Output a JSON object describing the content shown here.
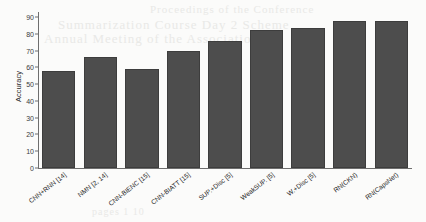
{
  "chart_data": {
    "type": "bar",
    "title": "",
    "xlabel": "",
    "ylabel": "Accuracy",
    "ylim": [
      0,
      93
    ],
    "yticks": [
      0,
      10,
      20,
      30,
      40,
      50,
      60,
      70,
      80,
      90
    ],
    "grid": false,
    "legend": null,
    "bar_color": "#4d4d4d",
    "categories": [
      "CNN+RNN [14]",
      "NMN [2, 14]",
      "CNN-BIENC [15]",
      "CNN-BIATT [15]",
      "SUP.+Disc [5]",
      "WeakSUP. [5]",
      "W.+Disc [5]",
      "RN(CKN)",
      "RN(CapsNet)"
    ],
    "values": [
      58,
      66,
      59,
      70,
      76,
      82,
      83.5,
      87.5,
      87.5
    ]
  },
  "background": {
    "bleed_text_1": "Summarization Course Day 2 Scheme",
    "bleed_text_2": "Annual Meeting of the Association",
    "bleed_text_3": "Proceedings of the Conference",
    "bleed_text_4": "pages 1 10"
  },
  "colors": {
    "bar": "#4d4d4d",
    "axis": "#6e6e6e",
    "text": "#262626",
    "page": "#fbfbfa"
  }
}
